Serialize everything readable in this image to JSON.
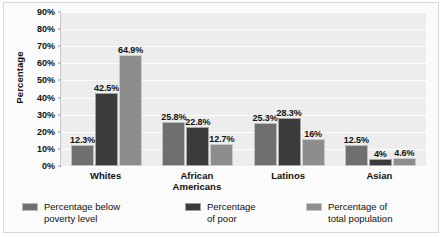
{
  "chart_data": {
    "type": "bar",
    "title": "",
    "xlabel": "",
    "ylabel": "Percentage",
    "ylim": [
      0,
      90
    ],
    "ytick_step": 10,
    "grid": true,
    "legend_position": "bottom",
    "categories": [
      "Whites",
      "African Americans",
      "Latinos",
      "Asian"
    ],
    "category_lines": [
      [
        "Whites"
      ],
      [
        "African",
        "Americans"
      ],
      [
        "Latinos"
      ],
      [
        "Asian"
      ]
    ],
    "ytick_labels": [
      "90%",
      "80%",
      "70%",
      "60%",
      "50%",
      "40%",
      "30%",
      "20%",
      "10%",
      "0%"
    ],
    "ytick_values": [
      90,
      80,
      70,
      60,
      50,
      40,
      30,
      20,
      10,
      0
    ],
    "series": [
      {
        "name": "Percentage below poverty level",
        "name_lines": [
          "Percentage below",
          "poverty level"
        ],
        "color": "#6f6f6f",
        "values": [
          12.3,
          25.8,
          25.3,
          12.5
        ],
        "labels": [
          "12.3%",
          "25.8%",
          "25.3%",
          "12.5%"
        ]
      },
      {
        "name": "Percentage of poor",
        "name_lines": [
          "Percentage",
          "of poor"
        ],
        "color": "#3b3b3b",
        "values": [
          42.5,
          22.8,
          28.3,
          4.0
        ],
        "labels": [
          "42.5%",
          "22.8%",
          "28.3%",
          "4%"
        ]
      },
      {
        "name": "Percentage of total population",
        "name_lines": [
          "Percentage of",
          "total population"
        ],
        "color": "#8d8d8d",
        "values": [
          64.9,
          12.7,
          16.0,
          4.6
        ],
        "labels": [
          "64.9%",
          "12.7%",
          "16%",
          "4.6%"
        ]
      }
    ]
  },
  "colors": {
    "plot_background": "#ededed",
    "gridline": "#ffffff",
    "frame_border": "#d8d8d8",
    "axis_line": "#c9c9c9",
    "text": "#111111"
  }
}
